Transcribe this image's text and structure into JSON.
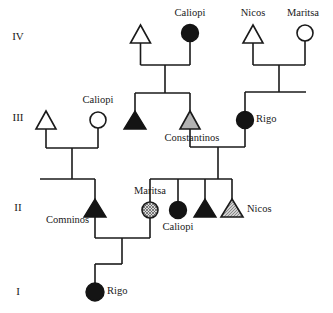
{
  "figure": {
    "type": "pedigree-chart",
    "width": 333,
    "height": 313,
    "background": "#ffffff",
    "line_color": "#1a1a1a"
  },
  "generation_labels": [
    {
      "id": "gen-iv",
      "text": "IV",
      "x": 18,
      "y": 37
    },
    {
      "id": "gen-iii",
      "text": "III",
      "x": 18,
      "y": 118
    },
    {
      "id": "gen-ii",
      "text": "II",
      "x": 18,
      "y": 208
    },
    {
      "id": "gen-i",
      "text": "I",
      "x": 18,
      "y": 292
    }
  ],
  "legend_fills": {
    "unaffected": "#ffffff",
    "affected": "#141414",
    "partial_gray": "#b3b3b3",
    "hatched": "hatch"
  },
  "individuals": [
    {
      "id": "iv-male-1",
      "generation": "IV",
      "sex": "male",
      "shape": "triangle",
      "fill": "open",
      "name": "",
      "x": 140.5,
      "y": 34,
      "label_pos": "none"
    },
    {
      "id": "iv-female-caliopi",
      "generation": "IV",
      "sex": "female",
      "shape": "circle",
      "fill": "filled",
      "name": "Caliopi",
      "x": 190,
      "y": 33,
      "label_pos": "above"
    },
    {
      "id": "iv-male-nicos",
      "generation": "IV",
      "sex": "male",
      "shape": "triangle",
      "fill": "open",
      "name": "Nicos",
      "x": 253,
      "y": 34,
      "label_pos": "above"
    },
    {
      "id": "iv-female-maritsa",
      "generation": "IV",
      "sex": "female",
      "shape": "circle",
      "fill": "open",
      "name": "Maritsa",
      "x": 305,
      "y": 33,
      "label_pos": "above"
    },
    {
      "id": "iii-male-1",
      "generation": "III",
      "sex": "male",
      "shape": "triangle",
      "fill": "open",
      "name": "",
      "x": 46,
      "y": 120,
      "label_pos": "none"
    },
    {
      "id": "iii-female-caliopi",
      "generation": "III",
      "sex": "female",
      "shape": "circle",
      "fill": "open",
      "name": "Caliopi",
      "x": 98,
      "y": 120,
      "label_pos": "above"
    },
    {
      "id": "iii-male-affected",
      "generation": "III",
      "sex": "male",
      "shape": "triangle",
      "fill": "filled",
      "name": "",
      "x": 135,
      "y": 120,
      "label_pos": "none"
    },
    {
      "id": "iii-male-constantinos",
      "generation": "III",
      "sex": "male",
      "shape": "triangle",
      "fill": "gray",
      "name": "Constantinos",
      "x": 190,
      "y": 120,
      "label_pos": "below"
    },
    {
      "id": "iii-female-rigo",
      "generation": "III",
      "sex": "female",
      "shape": "circle",
      "fill": "filled",
      "name": "Rigo",
      "x": 245,
      "y": 120,
      "label_pos": "right"
    },
    {
      "id": "ii-male-comninos",
      "generation": "II",
      "sex": "male",
      "shape": "triangle",
      "fill": "filled",
      "name": "Comninos",
      "x": 95,
      "y": 210,
      "label_pos": "below-left"
    },
    {
      "id": "ii-female-maritsa",
      "generation": "II",
      "sex": "female",
      "shape": "circle",
      "fill": "hatched",
      "name": "Maritsa",
      "x": 150,
      "y": 210,
      "label_pos": "above"
    },
    {
      "id": "ii-female-caliopi",
      "generation": "II",
      "sex": "female",
      "shape": "circle",
      "fill": "filled",
      "name": "Caliopi",
      "x": 178,
      "y": 210,
      "label_pos": "below"
    },
    {
      "id": "ii-male-affected",
      "generation": "II",
      "sex": "male",
      "shape": "triangle",
      "fill": "filled",
      "name": "",
      "x": 205,
      "y": 210,
      "label_pos": "none"
    },
    {
      "id": "ii-male-nicos",
      "generation": "II",
      "sex": "male",
      "shape": "triangle",
      "fill": "hatched-gray",
      "name": "Nicos",
      "x": 232,
      "y": 210,
      "label_pos": "right"
    },
    {
      "id": "i-female-rigo",
      "generation": "I",
      "sex": "female",
      "shape": "circle",
      "fill": "filled",
      "name": "Rigo",
      "x": 95,
      "y": 292,
      "label_pos": "right"
    }
  ],
  "names": {
    "caliopi_iv": "Caliopi",
    "nicos_iv": "Nicos",
    "maritsa_iv": "Maritsa",
    "caliopi_iii": "Caliopi",
    "constantinos": "Constantinos",
    "rigo_iii": "Rigo",
    "comninos": "Comninos",
    "maritsa_ii": "Maritsa",
    "caliopi_ii": "Caliopi",
    "nicos_ii": "Nicos",
    "rigo_i": "Rigo"
  }
}
